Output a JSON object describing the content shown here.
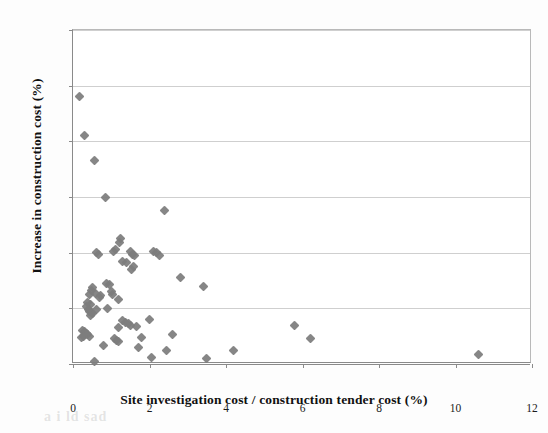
{
  "figure": {
    "background_color": "#fdfdfd",
    "plot_background_color": "#ffffff",
    "marker_color": "#7d7d7d",
    "gridline_color": "#cfcfcf",
    "axis_color": "#8a8a8a"
  },
  "chart_data": {
    "type": "scatter",
    "title": "",
    "xlabel": "Site investigation cost / construction tender cost (%)",
    "ylabel": "Increase in construction cost (%)",
    "xlim": [
      0,
      12
    ],
    "ylim": [
      0,
      120
    ],
    "xticks": [
      0,
      2,
      4,
      6,
      8,
      10,
      12
    ],
    "yticks": [
      0,
      20,
      40,
      60,
      80,
      100,
      120
    ],
    "xtick_labels": [
      "0",
      "2",
      "4",
      "6",
      "8",
      "10",
      "12"
    ],
    "ytick_labels": [
      "0",
      "20",
      "40",
      "60",
      "80",
      "100",
      "120"
    ],
    "grid": "horizontal",
    "legend": "none",
    "marker": "diamond",
    "series": [
      {
        "name": "Projects",
        "color": "#7d7d7d",
        "points": [
          [
            0.18,
            96.0
          ],
          [
            0.3,
            82.0
          ],
          [
            0.55,
            73.0
          ],
          [
            0.85,
            60.0
          ],
          [
            2.4,
            55.0
          ],
          [
            1.25,
            45.0
          ],
          [
            1.22,
            43.5
          ],
          [
            1.1,
            41.0
          ],
          [
            1.05,
            40.5
          ],
          [
            0.62,
            40.0
          ],
          [
            0.66,
            39.5
          ],
          [
            1.5,
            40.5
          ],
          [
            1.55,
            39.5
          ],
          [
            1.62,
            39.0
          ],
          [
            2.1,
            40.5
          ],
          [
            2.18,
            40.0
          ],
          [
            2.25,
            39.0
          ],
          [
            1.3,
            37.0
          ],
          [
            1.4,
            36.5
          ],
          [
            1.58,
            35.0
          ],
          [
            1.52,
            34.0
          ],
          [
            2.8,
            31.0
          ],
          [
            3.4,
            28.0
          ],
          [
            0.88,
            29.0
          ],
          [
            0.95,
            28.5
          ],
          [
            0.52,
            27.5
          ],
          [
            0.48,
            26.5
          ],
          [
            0.58,
            25.5
          ],
          [
            0.42,
            25.0
          ],
          [
            0.72,
            24.5
          ],
          [
            0.7,
            24.0
          ],
          [
            1.0,
            26.0
          ],
          [
            1.02,
            25.0
          ],
          [
            1.18,
            23.0
          ],
          [
            0.38,
            22.0
          ],
          [
            0.45,
            21.5
          ],
          [
            0.35,
            20.5
          ],
          [
            0.4,
            19.5
          ],
          [
            0.44,
            19.0
          ],
          [
            0.48,
            18.5
          ],
          [
            0.5,
            18.0
          ],
          [
            0.46,
            17.5
          ],
          [
            0.62,
            19.5
          ],
          [
            0.9,
            20.0
          ],
          [
            2.0,
            16.0
          ],
          [
            1.3,
            15.5
          ],
          [
            1.38,
            15.0
          ],
          [
            1.45,
            14.5
          ],
          [
            1.5,
            14.0
          ],
          [
            1.2,
            13.0
          ],
          [
            1.65,
            13.5
          ],
          [
            5.8,
            14.0
          ],
          [
            0.25,
            12.0
          ],
          [
            0.3,
            11.5
          ],
          [
            0.34,
            11.0
          ],
          [
            0.38,
            10.5
          ],
          [
            0.42,
            10.0
          ],
          [
            0.28,
            10.0
          ],
          [
            0.22,
            9.5
          ],
          [
            1.08,
            9.0
          ],
          [
            1.14,
            8.5
          ],
          [
            1.2,
            8.0
          ],
          [
            2.6,
            10.5
          ],
          [
            6.2,
            9.0
          ],
          [
            0.8,
            6.5
          ],
          [
            1.7,
            6.0
          ],
          [
            1.8,
            9.5
          ],
          [
            2.45,
            5.0
          ],
          [
            4.2,
            5.0
          ],
          [
            2.05,
            2.5
          ],
          [
            3.5,
            2.0
          ],
          [
            0.55,
            1.0
          ],
          [
            10.6,
            3.5
          ]
        ]
      }
    ]
  },
  "bleed_text": "a    i ld  sad"
}
